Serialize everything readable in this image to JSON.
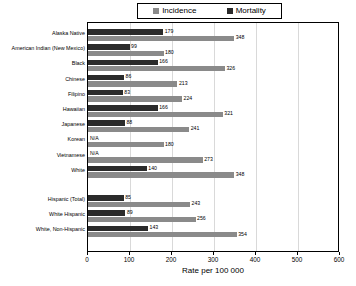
{
  "chart_data": {
    "type": "bar",
    "orientation": "horizontal",
    "title": "",
    "xlabel": "Rate per 100 000",
    "ylabel": "",
    "xlim": [
      0,
      600
    ],
    "xticks": [
      0,
      100,
      200,
      300,
      400,
      500,
      600
    ],
    "grid": false,
    "legend_position": "top",
    "categories": [
      "Alaska Native",
      "American Indian (New Mexico)",
      "Black",
      "Chinese",
      "Filipino",
      "Hawaiian",
      "Japanese",
      "Korean",
      "Vietnamese",
      "White",
      "Hispanic (Total)",
      "White Hispanic",
      "White, Non-Hispanic"
    ],
    "series": [
      {
        "name": "Incidence",
        "color": "#8a8a8a",
        "values": [
          348,
          180,
          326,
          213,
          224,
          321,
          241,
          180,
          273,
          348,
          243,
          256,
          354
        ],
        "labels": [
          "348",
          "180",
          "326",
          "213",
          "224",
          "321",
          "241",
          "180",
          "273",
          "348",
          "243",
          "256",
          "354"
        ]
      },
      {
        "name": "Mortality",
        "color": "#2b2b2b",
        "values": [
          179,
          99,
          166,
          86,
          83,
          166,
          88,
          null,
          null,
          140,
          85,
          89,
          143
        ],
        "labels": [
          "179",
          "99",
          "166",
          "86",
          "83",
          "166",
          "88",
          "N/A",
          "N/A",
          "140",
          "85",
          "89",
          "143"
        ]
      }
    ],
    "group_break_after_category": "White"
  },
  "legend": {
    "items": [
      {
        "label": "Incidence",
        "color": "#8a8a8a"
      },
      {
        "label": "Mortality",
        "color": "#2b2b2b"
      }
    ]
  },
  "axis": {
    "x_title": "Rate per 100 000",
    "tick_labels": [
      "0",
      "100",
      "200",
      "300",
      "400",
      "500",
      "600"
    ]
  }
}
